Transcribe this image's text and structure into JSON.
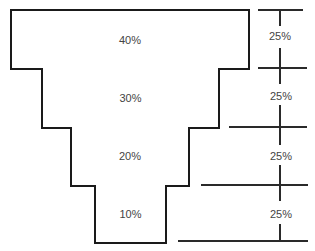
{
  "diagram": {
    "type": "inverted-pyramid",
    "tiers": [
      {
        "label": "40%"
      },
      {
        "label": "30%"
      },
      {
        "label": "20%"
      },
      {
        "label": "10%"
      }
    ],
    "scale": {
      "segments": [
        {
          "label": "25%"
        },
        {
          "label": "25%"
        },
        {
          "label": "25%"
        },
        {
          "label": "25%"
        }
      ]
    }
  }
}
